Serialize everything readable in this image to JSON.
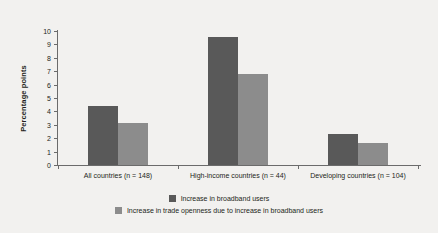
{
  "chart_data": {
    "type": "bar",
    "title": "",
    "subtitle": "",
    "xlabel": "",
    "ylabel": "Percentage points",
    "ylim": [
      0,
      10
    ],
    "ytick_labels": [
      "0",
      "1",
      "2",
      "3",
      "4",
      "5",
      "6",
      "7",
      "8",
      "9",
      "10"
    ],
    "ytick_values": [
      0,
      1,
      2,
      3,
      4,
      5,
      6,
      7,
      8,
      9,
      10
    ],
    "grid": false,
    "legend_position": "bottom",
    "categories": [
      "All countries (n = 148)",
      "High-income countries (n = 44)",
      "Developing countries (n = 104)"
    ],
    "series": [
      {
        "name": "Increase in broadband users",
        "color": "#595959",
        "values": [
          4.4,
          9.55,
          2.3
        ]
      },
      {
        "name": "Increase in trade openness due to increase in broadband users",
        "color": "#8c8c8c",
        "values": [
          3.15,
          6.8,
          1.65
        ]
      }
    ]
  },
  "axes": {
    "y_title": "Percentage points"
  },
  "legend": {
    "entries": [
      {
        "swatch": "dark",
        "label": "Increase in broadband users"
      },
      {
        "swatch": "light",
        "label": "Increase in trade openness due to increase in broadband users"
      }
    ]
  },
  "colors": {
    "background": "#f2f1ef",
    "axis": "#6b6b6b",
    "text": "#231f20",
    "series_dark": "#595959",
    "series_light": "#8c8c8c"
  }
}
